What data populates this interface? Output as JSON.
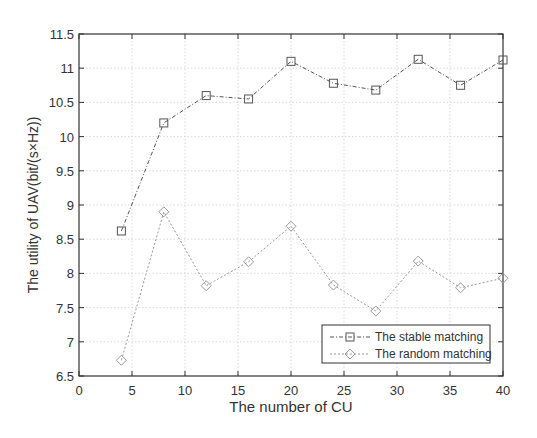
{
  "chart_data": {
    "type": "line",
    "title": "",
    "xlabel": "The number of CU",
    "ylabel": "The utility of UAV(bit/(s×Hz))",
    "xlim": [
      0,
      40
    ],
    "ylim": [
      6.5,
      11.5
    ],
    "xticks": [
      0,
      5,
      10,
      15,
      20,
      25,
      30,
      35,
      40
    ],
    "yticks": [
      6.5,
      7,
      7.5,
      8,
      8.5,
      9,
      9.5,
      10,
      10.5,
      11,
      11.5
    ],
    "grid": true,
    "legend_position": "lower right",
    "x": [
      4,
      8,
      12,
      16,
      20,
      24,
      28,
      32,
      36,
      40
    ],
    "series": [
      {
        "name": "The stable matching",
        "marker": "square",
        "line_style": "dash-dot",
        "color": "#555555",
        "values": [
          8.62,
          10.2,
          10.6,
          10.55,
          11.1,
          10.78,
          10.68,
          11.13,
          10.75,
          11.12
        ]
      },
      {
        "name": "The random matching",
        "marker": "diamond",
        "line_style": "dotted",
        "color": "#999999",
        "values": [
          6.73,
          8.9,
          7.82,
          8.17,
          8.69,
          7.83,
          7.45,
          8.18,
          7.79,
          7.93
        ]
      }
    ]
  }
}
